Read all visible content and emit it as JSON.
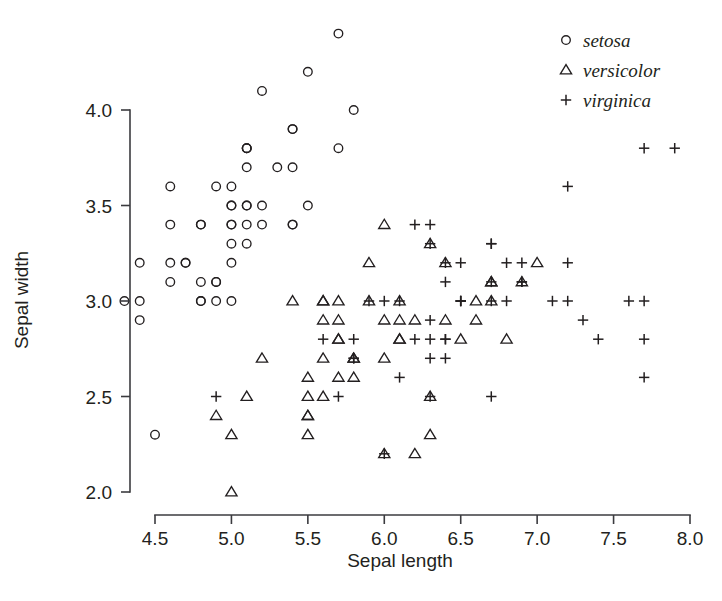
{
  "chart_data": {
    "type": "scatter",
    "title": "",
    "subtitle": "",
    "xlabel": "Sepal length",
    "ylabel": "Sepal width",
    "xlim": [
      4.3,
      8.0
    ],
    "ylim": [
      2.0,
      4.4
    ],
    "xticks": [
      4.5,
      5.0,
      5.5,
      6.0,
      6.5,
      7.0,
      7.5,
      8.0
    ],
    "yticks": [
      2.0,
      2.5,
      3.0,
      3.5,
      4.0
    ],
    "xtick_labels": [
      "4.5",
      "5.0",
      "5.5",
      "6.0",
      "6.5",
      "7.0",
      "7.5",
      "8.0"
    ],
    "ytick_labels": [
      "2.0",
      "2.5",
      "3.0",
      "3.5",
      "4.0"
    ],
    "grid": false,
    "legend_position": "top-right",
    "legend": [
      {
        "name": "setosa",
        "marker": "circle"
      },
      {
        "name": "versicolor",
        "marker": "triangle"
      },
      {
        "name": "virginica",
        "marker": "plus"
      }
    ],
    "marker_color": "#231f20",
    "series": [
      {
        "name": "setosa",
        "marker": "circle",
        "points": [
          [
            5.1,
            3.5
          ],
          [
            4.9,
            3.0
          ],
          [
            4.7,
            3.2
          ],
          [
            4.6,
            3.1
          ],
          [
            5.0,
            3.6
          ],
          [
            5.4,
            3.9
          ],
          [
            4.6,
            3.4
          ],
          [
            5.0,
            3.4
          ],
          [
            4.4,
            2.9
          ],
          [
            4.9,
            3.1
          ],
          [
            5.4,
            3.7
          ],
          [
            4.8,
            3.4
          ],
          [
            4.8,
            3.0
          ],
          [
            4.3,
            3.0
          ],
          [
            5.8,
            4.0
          ],
          [
            5.7,
            4.4
          ],
          [
            5.4,
            3.9
          ],
          [
            5.1,
            3.5
          ],
          [
            5.7,
            3.8
          ],
          [
            5.1,
            3.8
          ],
          [
            5.4,
            3.4
          ],
          [
            5.1,
            3.7
          ],
          [
            4.6,
            3.6
          ],
          [
            5.1,
            3.3
          ],
          [
            4.8,
            3.4
          ],
          [
            5.0,
            3.0
          ],
          [
            5.0,
            3.4
          ],
          [
            5.2,
            3.5
          ],
          [
            5.2,
            3.4
          ],
          [
            4.7,
            3.2
          ],
          [
            4.8,
            3.1
          ],
          [
            5.4,
            3.4
          ],
          [
            5.2,
            4.1
          ],
          [
            5.5,
            4.2
          ],
          [
            4.9,
            3.1
          ],
          [
            5.0,
            3.2
          ],
          [
            5.5,
            3.5
          ],
          [
            4.9,
            3.6
          ],
          [
            4.4,
            3.0
          ],
          [
            5.1,
            3.4
          ],
          [
            5.0,
            3.5
          ],
          [
            4.5,
            2.3
          ],
          [
            4.4,
            3.2
          ],
          [
            5.0,
            3.5
          ],
          [
            5.1,
            3.8
          ],
          [
            4.8,
            3.0
          ],
          [
            5.1,
            3.8
          ],
          [
            4.6,
            3.2
          ],
          [
            5.3,
            3.7
          ],
          [
            5.0,
            3.3
          ]
        ]
      },
      {
        "name": "versicolor",
        "marker": "triangle",
        "points": [
          [
            7.0,
            3.2
          ],
          [
            6.4,
            3.2
          ],
          [
            6.9,
            3.1
          ],
          [
            5.5,
            2.3
          ],
          [
            6.5,
            2.8
          ],
          [
            5.7,
            2.8
          ],
          [
            6.3,
            3.3
          ],
          [
            4.9,
            2.4
          ],
          [
            6.6,
            2.9
          ],
          [
            5.2,
            2.7
          ],
          [
            5.0,
            2.0
          ],
          [
            5.9,
            3.0
          ],
          [
            6.0,
            2.2
          ],
          [
            6.1,
            2.9
          ],
          [
            5.6,
            2.9
          ],
          [
            6.7,
            3.1
          ],
          [
            5.6,
            3.0
          ],
          [
            5.8,
            2.7
          ],
          [
            6.2,
            2.2
          ],
          [
            5.6,
            2.5
          ],
          [
            5.9,
            3.2
          ],
          [
            6.1,
            2.8
          ],
          [
            6.3,
            2.5
          ],
          [
            6.1,
            2.8
          ],
          [
            6.4,
            2.9
          ],
          [
            6.6,
            3.0
          ],
          [
            6.8,
            2.8
          ],
          [
            6.7,
            3.0
          ],
          [
            6.0,
            2.9
          ],
          [
            5.7,
            2.6
          ],
          [
            5.5,
            2.4
          ],
          [
            5.5,
            2.4
          ],
          [
            5.8,
            2.7
          ],
          [
            6.0,
            2.7
          ],
          [
            5.4,
            3.0
          ],
          [
            6.0,
            3.4
          ],
          [
            6.7,
            3.1
          ],
          [
            6.3,
            2.3
          ],
          [
            5.6,
            3.0
          ],
          [
            5.5,
            2.5
          ],
          [
            5.5,
            2.6
          ],
          [
            6.1,
            3.0
          ],
          [
            5.8,
            2.6
          ],
          [
            5.0,
            2.3
          ],
          [
            5.6,
            2.7
          ],
          [
            5.7,
            3.0
          ],
          [
            5.7,
            2.9
          ],
          [
            6.2,
            2.9
          ],
          [
            5.1,
            2.5
          ],
          [
            5.7,
            2.8
          ]
        ]
      },
      {
        "name": "virginica",
        "marker": "plus",
        "points": [
          [
            6.3,
            3.3
          ],
          [
            5.8,
            2.7
          ],
          [
            7.1,
            3.0
          ],
          [
            6.3,
            2.9
          ],
          [
            6.5,
            3.0
          ],
          [
            7.6,
            3.0
          ],
          [
            4.9,
            2.5
          ],
          [
            7.3,
            2.9
          ],
          [
            6.7,
            2.5
          ],
          [
            7.2,
            3.6
          ],
          [
            6.5,
            3.2
          ],
          [
            6.4,
            2.7
          ],
          [
            6.8,
            3.0
          ],
          [
            5.7,
            2.5
          ],
          [
            5.8,
            2.8
          ],
          [
            6.4,
            3.2
          ],
          [
            6.5,
            3.0
          ],
          [
            7.7,
            3.8
          ],
          [
            7.7,
            2.6
          ],
          [
            6.0,
            2.2
          ],
          [
            6.9,
            3.2
          ],
          [
            5.6,
            2.8
          ],
          [
            7.7,
            2.8
          ],
          [
            6.3,
            2.7
          ],
          [
            6.7,
            3.3
          ],
          [
            7.2,
            3.2
          ],
          [
            6.2,
            2.8
          ],
          [
            6.1,
            3.0
          ],
          [
            6.4,
            2.8
          ],
          [
            7.2,
            3.0
          ],
          [
            7.4,
            2.8
          ],
          [
            7.9,
            3.8
          ],
          [
            6.4,
            2.8
          ],
          [
            6.3,
            2.8
          ],
          [
            6.1,
            2.6
          ],
          [
            7.7,
            3.0
          ],
          [
            6.3,
            3.4
          ],
          [
            6.4,
            3.1
          ],
          [
            6.0,
            3.0
          ],
          [
            6.9,
            3.1
          ],
          [
            6.7,
            3.1
          ],
          [
            6.9,
            3.1
          ],
          [
            5.8,
            2.7
          ],
          [
            6.8,
            3.2
          ],
          [
            6.7,
            3.3
          ],
          [
            6.7,
            3.0
          ],
          [
            6.3,
            2.5
          ],
          [
            6.5,
            3.0
          ],
          [
            6.2,
            3.4
          ],
          [
            5.9,
            3.0
          ]
        ]
      }
    ]
  }
}
